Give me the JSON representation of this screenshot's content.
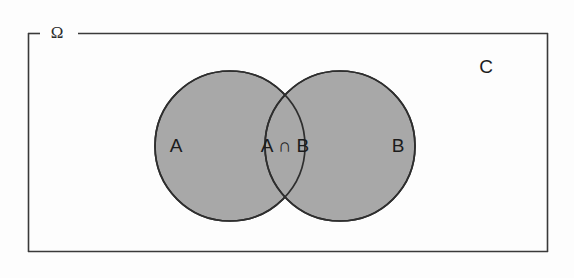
{
  "figure": {
    "kind": "venn-diagram",
    "width": 574,
    "height": 278,
    "background_color": "#fdfdfd"
  },
  "universe": {
    "label": "Ω",
    "border_color": "#3a3a3a",
    "fill_color": "#ffffff"
  },
  "complement": {
    "label": "C"
  },
  "sets": {
    "left": {
      "label": "A",
      "fill_color": "#a8a8a8",
      "stroke_color": "#2e2e2e"
    },
    "right": {
      "label": "B",
      "fill_color": "#a8a8a8",
      "stroke_color": "#2e2e2e"
    },
    "intersection": {
      "label": "A ∩ B",
      "fill_color": "#a8a8a8"
    }
  },
  "geometry": {
    "rect": {
      "x": 28,
      "y": 33,
      "width": 520,
      "height": 219
    },
    "label_gap": {
      "start_x": 40,
      "end_x": 78
    },
    "left_circle": {
      "cx": 230,
      "cy": 146,
      "r": 75
    },
    "right_circle": {
      "cx": 340,
      "cy": 146,
      "r": 75
    },
    "label_positions": {
      "universe": {
        "x": 57,
        "y": 33
      },
      "complement": {
        "x": 486,
        "y": 68
      },
      "left": {
        "x": 176,
        "y": 147
      },
      "right": {
        "x": 398,
        "y": 147
      },
      "intersection": {
        "x": 285,
        "y": 147
      }
    }
  }
}
